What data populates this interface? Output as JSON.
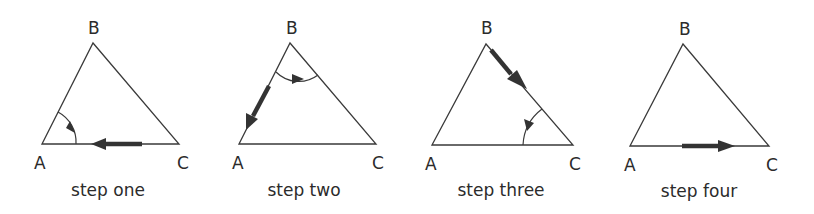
{
  "diagram": {
    "panels": [
      {
        "caption": "step one",
        "vertices": {
          "A": "A",
          "B": "B",
          "C": "C"
        },
        "moving_side": "CA",
        "rotation_angle": "A"
      },
      {
        "caption": "step two",
        "vertices": {
          "A": "A",
          "B": "B",
          "C": "C"
        },
        "moving_side": "BA",
        "rotation_angle": "B"
      },
      {
        "caption": "step three",
        "vertices": {
          "A": "A",
          "B": "B",
          "C": "C"
        },
        "moving_side": "BC",
        "rotation_angle": "C"
      },
      {
        "caption": "step four",
        "vertices": {
          "A": "A",
          "B": "B",
          "C": "C"
        },
        "moving_side": "AC",
        "rotation_angle": null
      }
    ],
    "colors": {
      "line": "#3a3a3a",
      "arrow": "#333333",
      "text": "#2b2b2b"
    }
  }
}
